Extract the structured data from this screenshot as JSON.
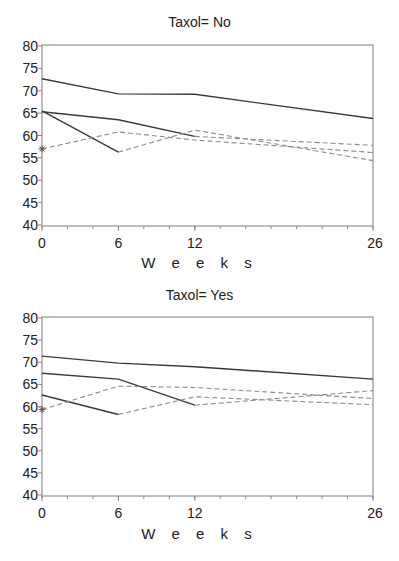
{
  "chart_data": [
    {
      "type": "line",
      "title": "Taxol= No",
      "xlabel": "W e e k s",
      "ylabel": "",
      "x_ticks": [
        0,
        6,
        12,
        26
      ],
      "y_ticks": [
        40,
        45,
        50,
        55,
        60,
        65,
        70,
        75,
        80
      ],
      "xlim": [
        0,
        26
      ],
      "ylim": [
        40,
        80
      ],
      "grid": false,
      "legend": "none",
      "series": [
        {
          "name": "solid-1",
          "style": "solid",
          "x": [
            0,
            6,
            12,
            26
          ],
          "values": [
            72.7,
            69.3,
            69.2,
            63.8
          ]
        },
        {
          "name": "solid-2",
          "style": "solid",
          "x": [
            0,
            6,
            12
          ],
          "values": [
            65.3,
            63.5,
            59.8
          ]
        },
        {
          "name": "solid-3",
          "style": "solid",
          "x": [
            0,
            6
          ],
          "values": [
            65.5,
            56.3
          ]
        },
        {
          "name": "dashed-1",
          "style": "dashed",
          "x": [
            0,
            6,
            12,
            26
          ],
          "values": [
            57.0,
            60.8,
            59.0,
            56.2
          ]
        },
        {
          "name": "dashed-2",
          "style": "dashed",
          "x": [
            6,
            12,
            26
          ],
          "values": [
            56.3,
            61.2,
            54.4
          ]
        },
        {
          "name": "dashed-3",
          "style": "dashed",
          "x": [
            12,
            26
          ],
          "values": [
            59.8,
            57.8
          ]
        }
      ],
      "markers": [
        {
          "symbol": "star",
          "x": 0,
          "y": 57.0
        }
      ]
    },
    {
      "type": "line",
      "title": "Taxol= Yes",
      "xlabel": "W e e k s",
      "ylabel": "",
      "x_ticks": [
        0,
        6,
        12,
        26
      ],
      "y_ticks": [
        40,
        45,
        50,
        55,
        60,
        65,
        70,
        75,
        80
      ],
      "xlim": [
        0,
        26
      ],
      "ylim": [
        40,
        80
      ],
      "grid": false,
      "legend": "none",
      "series": [
        {
          "name": "solid-1",
          "style": "solid",
          "x": [
            0,
            6,
            12,
            26
          ],
          "values": [
            71.4,
            69.8,
            69.0,
            66.2
          ]
        },
        {
          "name": "solid-2",
          "style": "solid",
          "x": [
            0,
            6,
            12
          ],
          "values": [
            67.5,
            66.2,
            60.3
          ]
        },
        {
          "name": "solid-3",
          "style": "solid",
          "x": [
            0,
            6
          ],
          "values": [
            62.6,
            58.2
          ]
        },
        {
          "name": "dashed-1",
          "style": "dashed",
          "x": [
            0,
            6,
            12,
            26
          ],
          "values": [
            59.3,
            64.6,
            64.3,
            61.8
          ]
        },
        {
          "name": "dashed-2",
          "style": "dashed",
          "x": [
            6,
            12,
            26
          ],
          "values": [
            58.2,
            62.2,
            60.4
          ]
        },
        {
          "name": "dashed-3",
          "style": "dashed",
          "x": [
            12,
            26
          ],
          "values": [
            60.3,
            63.6
          ]
        }
      ],
      "markers": [
        {
          "symbol": "star",
          "x": 0,
          "y": 59.3
        }
      ]
    }
  ],
  "panels": [
    {
      "title": "Taxol= No",
      "xtitle": "W e e k s"
    },
    {
      "title": "Taxol= Yes",
      "xtitle": "W e e k s"
    }
  ]
}
